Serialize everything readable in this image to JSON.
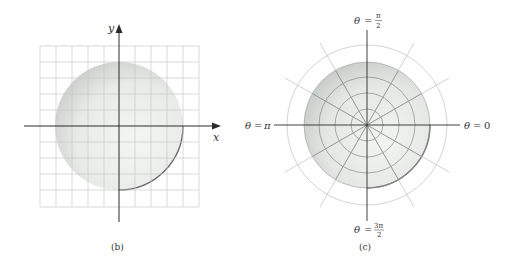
{
  "panels": [
    {
      "id": "b",
      "caption": "(b)",
      "type": "cartesian-grid",
      "axis_labels": {
        "x": "x",
        "y": "y"
      },
      "grid": {
        "rows": 10,
        "cols": 10
      },
      "shaded_region": "disk centered at origin, radius 4 grid units"
    },
    {
      "id": "c",
      "caption": "(c)",
      "type": "polar-grid",
      "angle_labels": {
        "top": {
          "lhs": "θ",
          "eq": "=",
          "num": "π",
          "den": "2"
        },
        "left": {
          "lhs": "θ",
          "eq": "=",
          "val": "π"
        },
        "right": {
          "lhs": "θ",
          "eq": "=",
          "val": "0"
        },
        "bottom": {
          "lhs": "θ",
          "eq": "=",
          "num": "3π",
          "den": "2"
        }
      },
      "rings": 5,
      "rays": 12,
      "shaded_region": "disk of radius 4 rings"
    }
  ],
  "colors": {
    "grid": "#c8c8c8",
    "axis": "#2a2a2a",
    "shade_light": "#f3f5f3",
    "shade_dark": "#c9cdc9",
    "rim": "#6b6b6b"
  }
}
